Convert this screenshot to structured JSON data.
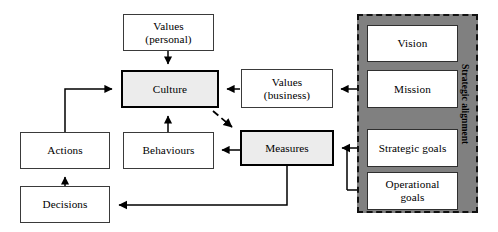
{
  "diagram": {
    "type": "block-flow-diagram",
    "colors": {
      "panel_fill": "#808080",
      "panel_border": "#111111",
      "node_fill": "#ffffff",
      "emphasis_node_fill": "#ececec",
      "node_border": "#3a3a3a",
      "emphasis_node_border": "#000000",
      "connector": "#000000",
      "background": "#ffffff"
    },
    "panel": {
      "label": "Strategic alignment",
      "border_style": "dashed"
    },
    "nodes": [
      {
        "id": "values-personal",
        "line1": "Values",
        "line2": "(personal)",
        "emphasis": false
      },
      {
        "id": "culture",
        "line1": "Culture",
        "line2": "",
        "emphasis": true
      },
      {
        "id": "values-business",
        "line1": "Values",
        "line2": "(business)",
        "emphasis": false
      },
      {
        "id": "behaviours",
        "line1": "Behaviours",
        "line2": "",
        "emphasis": false
      },
      {
        "id": "measures",
        "line1": "Measures",
        "line2": "",
        "emphasis": true
      },
      {
        "id": "actions",
        "line1": "Actions",
        "line2": "",
        "emphasis": false
      },
      {
        "id": "decisions",
        "line1": "Decisions",
        "line2": "",
        "emphasis": false
      },
      {
        "id": "vision",
        "line1": "Vision",
        "line2": "",
        "emphasis": false
      },
      {
        "id": "mission",
        "line1": "Mission",
        "line2": "",
        "emphasis": false
      },
      {
        "id": "strategic-goals",
        "line1": "Strategic goals",
        "line2": "",
        "emphasis": false
      },
      {
        "id": "operational-goals",
        "line1": "Operational",
        "line2": "goals",
        "emphasis": false
      }
    ],
    "connections": [
      {
        "from": "values-personal",
        "to": "culture",
        "style": "solid"
      },
      {
        "from": "values-business",
        "to": "culture",
        "style": "solid"
      },
      {
        "from": "mission",
        "to": "values-business",
        "style": "solid"
      },
      {
        "from": "culture",
        "to": "measures",
        "style": "dashed"
      },
      {
        "from": "measures",
        "to": "behaviours",
        "style": "solid"
      },
      {
        "from": "behaviours",
        "to": "culture",
        "style": "solid"
      },
      {
        "from": "actions",
        "to": "culture",
        "style": "solid"
      },
      {
        "from": "decisions",
        "to": "actions",
        "style": "solid"
      },
      {
        "from": "measures",
        "to": "decisions",
        "style": "solid"
      },
      {
        "from": "strategic-goals",
        "to": "measures",
        "style": "solid"
      },
      {
        "from": "operational-goals",
        "to": "measures",
        "style": "solid"
      }
    ]
  }
}
